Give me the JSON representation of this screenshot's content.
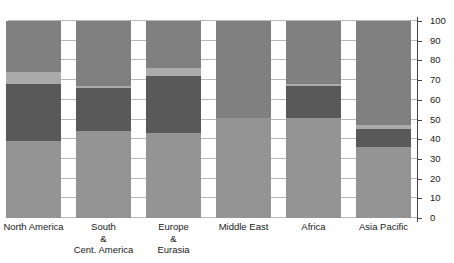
{
  "chart_data": {
    "type": "bar",
    "subtype": "stacked-100-percent",
    "title": "",
    "subtitle": "",
    "xlabel": "",
    "ylabel": "",
    "ylim": [
      0,
      100
    ],
    "yticks": [
      0,
      10,
      20,
      30,
      40,
      50,
      60,
      70,
      80,
      90,
      100
    ],
    "ytick_labels": [
      "0",
      "10",
      "20",
      "30",
      "40",
      "50",
      "60",
      "70",
      "80",
      "90",
      "100"
    ],
    "y_axis_position": "right",
    "grid": true,
    "grid_axis": "y",
    "legend": false,
    "legend_position": "none",
    "categories": [
      "North America",
      "South\n&\nCent. America",
      "Europe\n&\nEurasia",
      "Middle East",
      "Africa",
      "Asia Pacific"
    ],
    "series": [
      {
        "name": "Series 1",
        "color": "#949494",
        "values": [
          39,
          44,
          43,
          51,
          51,
          36
        ]
      },
      {
        "name": "Series 2",
        "color": "#595959",
        "values": [
          29,
          22,
          29,
          0,
          16,
          9
        ]
      },
      {
        "name": "Series 3",
        "color": "#ababab",
        "values": [
          6,
          1,
          4,
          0,
          1,
          2
        ]
      },
      {
        "name": "Series 4",
        "color": "#808080",
        "values": [
          26,
          33,
          24,
          49,
          32,
          53
        ]
      }
    ]
  },
  "axis": {
    "tick_color": "#444444",
    "label_color": "#1a1a1a",
    "grid_color": "#b9b9b9"
  },
  "layout": {
    "background": "#ffffff",
    "bar_width_px": 55,
    "bar_gap_px": 15
  }
}
